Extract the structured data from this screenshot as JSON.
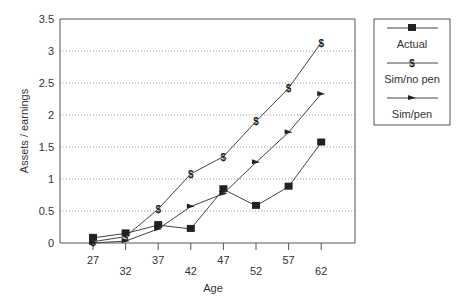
{
  "chart_data": {
    "type": "line",
    "title": "",
    "xlabel": "Age",
    "ylabel": "Assets / earnings",
    "x": [
      27,
      32,
      37,
      42,
      47,
      52,
      57,
      62
    ],
    "x_tick_labels": [
      "27",
      "32",
      "37",
      "42",
      "47",
      "52",
      "57",
      "62"
    ],
    "y_tick_labels": [
      "0",
      "0.5",
      "1",
      "1.5",
      "2",
      "2.5",
      "3",
      "3.5"
    ],
    "y_ticks": [
      0,
      0.5,
      1,
      1.5,
      2,
      2.5,
      3,
      3.5
    ],
    "ylim": [
      0,
      3.5
    ],
    "grid": "horizontal-dotted",
    "legend_position": "right",
    "series": [
      {
        "name": "Actual",
        "marker": "square",
        "values": [
          0.08,
          0.15,
          0.28,
          0.22,
          0.84,
          0.58,
          0.88,
          1.57
        ]
      },
      {
        "name": "Sim/no pen",
        "marker": "dollar",
        "values": [
          0.02,
          0.1,
          0.53,
          1.08,
          1.35,
          1.9,
          2.42,
          3.13
        ]
      },
      {
        "name": "Sim/pen",
        "marker": "triangle",
        "values": [
          0.0,
          0.03,
          0.22,
          0.57,
          0.77,
          1.26,
          1.73,
          2.33
        ]
      }
    ]
  }
}
